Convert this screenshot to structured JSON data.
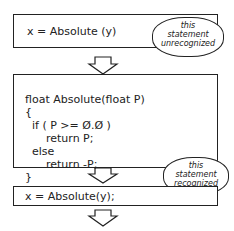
{
  "box1": {
    "statement": "x = Absolute (y)"
  },
  "bubble1": {
    "lines": [
      "this",
      "statement",
      "unrecognized"
    ]
  },
  "box2": {
    "lines": [
      "float Absolute(float P)",
      "{",
      "  if ( P >= Ø.Ø )",
      "      return P;",
      "  else",
      "      return -P;",
      "}"
    ]
  },
  "bubble2": {
    "lines": [
      "this",
      "statement",
      "recognized"
    ]
  },
  "box3": {
    "statement": "x = Absolute(y);"
  },
  "icons": {
    "bug": "bug-icon"
  }
}
